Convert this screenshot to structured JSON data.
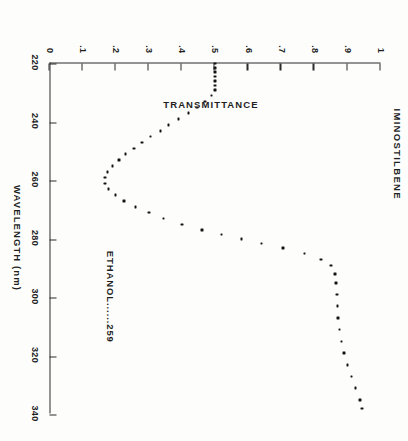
{
  "figure": {
    "title": "IMINOSTILBENE",
    "annotation": "ETHANOL......259",
    "rotation_degrees": 90
  },
  "chart_data": {
    "type": "scatter",
    "title": "IMINOSTILBENE",
    "xlabel": "WAVELENGTH  (nm)",
    "ylabel": "TRANSMITTANCE",
    "xlim": [
      220,
      340
    ],
    "ylim": [
      0,
      1
    ],
    "grid": false,
    "legend": null,
    "annotations": [
      "ETHANOL......259"
    ],
    "xticks": [
      220,
      240,
      260,
      280,
      300,
      320,
      340
    ],
    "xticklabels": [
      "220",
      "240",
      "260",
      "280",
      "300",
      "320",
      "340"
    ],
    "yticks": [
      0,
      0.1,
      0.2,
      0.3,
      0.4,
      0.5,
      0.6,
      0.7,
      0.8,
      0.9,
      1
    ],
    "yticklabels": [
      "0",
      ".1",
      ".2",
      ".3",
      ".4",
      ".5",
      ".6",
      ".7",
      ".8",
      ".9",
      "1"
    ],
    "x": [
      220,
      221.5,
      223,
      224.5,
      226,
      227.5,
      229,
      231,
      233,
      235,
      237,
      239,
      241,
      243,
      245,
      247,
      249,
      251,
      253,
      255,
      257,
      259,
      261,
      263,
      265,
      267,
      269,
      271,
      273,
      275,
      277,
      278.5,
      280,
      281.5,
      283,
      285,
      287,
      289,
      292,
      295,
      299,
      303,
      307,
      311,
      315,
      319,
      323,
      327,
      331,
      335,
      338
    ],
    "y": [
      0.5,
      0.5,
      0.5,
      0.5,
      0.5,
      0.5,
      0.5,
      0.49,
      0.47,
      0.445,
      0.42,
      0.39,
      0.36,
      0.335,
      0.305,
      0.28,
      0.255,
      0.23,
      0.21,
      0.19,
      0.175,
      0.168,
      0.168,
      0.178,
      0.2,
      0.225,
      0.26,
      0.3,
      0.345,
      0.4,
      0.46,
      0.52,
      0.58,
      0.64,
      0.705,
      0.77,
      0.82,
      0.85,
      0.862,
      0.865,
      0.868,
      0.87,
      0.872,
      0.876,
      0.882,
      0.89,
      0.9,
      0.912,
      0.925,
      0.938,
      0.945
    ],
    "series_name": "transmittance",
    "lambda_max_nm": 259,
    "solvent": "ETHANOL"
  }
}
